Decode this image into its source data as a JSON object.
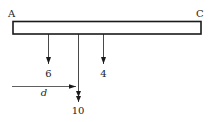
{
  "diagram": {
    "type": "beam-loading",
    "beam": {
      "left_label": "A",
      "right_label": "C",
      "x1": 13,
      "x2": 201,
      "y_top": 21,
      "y_bottom": 34
    },
    "loads": [
      {
        "label": "6",
        "x": 48,
        "y_end": 65
      },
      {
        "label": "10",
        "x": 78,
        "y_end": 103
      },
      {
        "label": "4",
        "x": 103,
        "y_end": 65
      }
    ],
    "dimension": {
      "label": "d",
      "x1": 12,
      "x2": 76,
      "y": 86
    },
    "colors": {
      "stroke": "#1a1a1a",
      "fill": "#ffffff"
    }
  }
}
